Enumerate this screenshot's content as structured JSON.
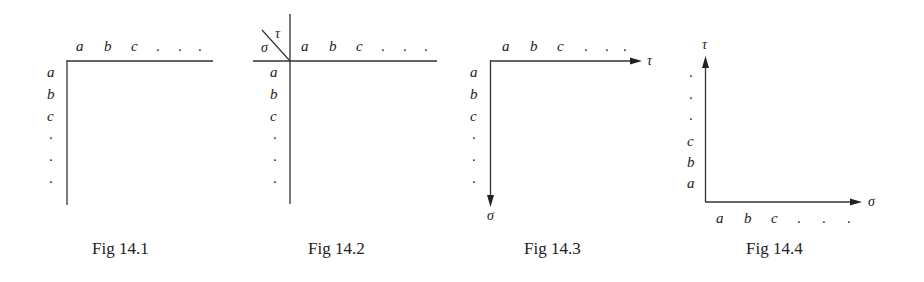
{
  "figures": [
    {
      "id": "fig-14-1",
      "caption": "Fig  14.1",
      "top_labels": [
        "a",
        "b",
        "c"
      ],
      "side_labels": [
        "a",
        "b",
        "c"
      ],
      "ellipsis": "."
    },
    {
      "id": "fig-14-2",
      "caption": "Fig  14.2",
      "corner_labels": {
        "upper": "τ",
        "lower": "σ"
      },
      "top_labels": [
        "a",
        "b",
        "c"
      ],
      "side_labels": [
        "a",
        "b",
        "c"
      ],
      "ellipsis": "."
    },
    {
      "id": "fig-14-3",
      "caption": "Fig  14.3",
      "top_labels": [
        "a",
        "b",
        "c"
      ],
      "side_labels": [
        "a",
        "b",
        "c"
      ],
      "axis_labels": {
        "horizontal": "τ",
        "vertical": "σ"
      },
      "ellipsis": "."
    },
    {
      "id": "fig-14-4",
      "caption": "Fig  14.4",
      "bottom_labels": [
        "a",
        "b",
        "c"
      ],
      "side_labels": [
        "c",
        "b",
        "a"
      ],
      "axis_labels": {
        "horizontal": "σ",
        "vertical": "τ"
      },
      "ellipsis": "."
    }
  ]
}
